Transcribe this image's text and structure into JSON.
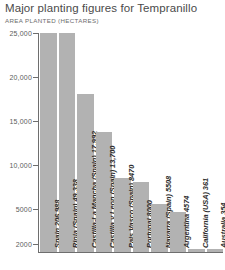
{
  "chart_data": {
    "type": "bar",
    "title": "Major planting figures for Tempranillo",
    "subtitle": "AREA PLANTED (HECTARES)",
    "xlabel": "",
    "ylabel": "AREA PLANTED (HECTARES)",
    "ylim": [
      0,
      25000
    ],
    "grid": false,
    "legend": "none",
    "orientation": "vertical",
    "bar_color": "#b2b2b2",
    "axis_color": "#6e6e6e",
    "y_ticks": [
      {
        "value": 25000,
        "label": "25,000"
      },
      {
        "value": 20000,
        "label": "20,000"
      },
      {
        "value": 15000,
        "label": "15,000"
      },
      {
        "value": 10000,
        "label": "10,000"
      },
      {
        "value": 5000,
        "label": "5000"
      },
      {
        "value": 2000,
        "label": "2000"
      }
    ],
    "categories": [
      "Spain",
      "Rioja (Spain)",
      "Castilla-La Mancha (Spain)",
      "Castilla y Leon (Spain)",
      "Pais Vasco (Spain)",
      "Portugal",
      "Navarra (Spain)",
      "Argentina",
      "California (USA)",
      "Australia"
    ],
    "values": [
      206988,
      49338,
      17992,
      13700,
      8470,
      8000,
      5508,
      4574,
      361,
      354
    ],
    "bar_labels": [
      "Spain 206,988",
      "Rioja (Spain) 49,338",
      "Castilla-La Mancha (Spain) 17,992",
      "Castilla y Leon (Spain) 13,700",
      "Pais Vasco (Spain) 8470",
      "Portugal 8000",
      "Navarra (Spain) 5508",
      "Argentina 4574",
      "California (USA) 361",
      "Australia 354"
    ],
    "note": "The first two bars (Spain 206,988 and Rioja 49,338) exceed the plotted axis maximum of 25,000 and are drawn clipped/truncated."
  }
}
